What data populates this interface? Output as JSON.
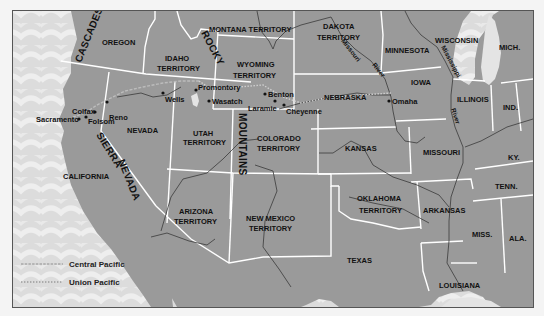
{
  "map": {
    "colors": {
      "land": "#9a9a9a",
      "ocean": "#dedede",
      "border": "#ffffff",
      "river": "#3a3a3a",
      "central_pacific": "#9a9a9a",
      "union_pacific": "#8a8a8a",
      "lake": "#e6e6e6"
    },
    "regions": [
      {
        "name": "OREGON"
      },
      {
        "name": "IDAHO",
        "line2": "TERRITORY"
      },
      {
        "name": "MONTANA TERRITORY"
      },
      {
        "name": "WYOMING",
        "line2": "TERRITORY"
      },
      {
        "name": "DAKOTA",
        "line2": "TERRITORY"
      },
      {
        "name": "MINNESOTA"
      },
      {
        "name": "WISCONSIN"
      },
      {
        "name": "MICH."
      },
      {
        "name": "IOWA"
      },
      {
        "name": "NEBRASKA"
      },
      {
        "name": "ILLINOIS"
      },
      {
        "name": "IND."
      },
      {
        "name": "NEVADA"
      },
      {
        "name": "UTAH",
        "line2": "TERRITORY"
      },
      {
        "name": "COLORADO",
        "line2": "TERRITORY"
      },
      {
        "name": "KANSAS"
      },
      {
        "name": "MISSOURI"
      },
      {
        "name": "KY."
      },
      {
        "name": "CALIFORNIA"
      },
      {
        "name": "ARIZONA",
        "line2": "TERRITORY"
      },
      {
        "name": "NEW MEXICO",
        "line2": "TERRITORY"
      },
      {
        "name": "OKLAHOMA",
        "line2": "TERRITORY"
      },
      {
        "name": "ARKANSAS"
      },
      {
        "name": "TENN."
      },
      {
        "name": "MISS."
      },
      {
        "name": "ALA."
      },
      {
        "name": "TEXAS"
      },
      {
        "name": "LOUISIANA"
      }
    ],
    "mountain_ranges": [
      {
        "name": "CASCADES"
      },
      {
        "name": "ROCKY"
      },
      {
        "name": "MOUNTAINS"
      },
      {
        "name": "SIERRA"
      },
      {
        "name": "NEVADA"
      }
    ],
    "rivers": [
      {
        "name": "Missouri River",
        "part1": "Missouri",
        "part2": "River"
      },
      {
        "name": "Mississippi River",
        "part1": "Mississippi",
        "part2": "River"
      }
    ],
    "cities": [
      {
        "name": "Sacramento"
      },
      {
        "name": "Folsom"
      },
      {
        "name": "Colfax"
      },
      {
        "name": "Reno"
      },
      {
        "name": "Wells"
      },
      {
        "name": "Promontory"
      },
      {
        "name": "Wasatch"
      },
      {
        "name": "Benton"
      },
      {
        "name": "Laramie"
      },
      {
        "name": "Cheyenne"
      },
      {
        "name": "Omaha"
      }
    ],
    "legend": {
      "items": [
        {
          "label": "Central Pacific",
          "style": "dashed"
        },
        {
          "label": "Union Pacific",
          "style": "dotted"
        }
      ]
    }
  }
}
